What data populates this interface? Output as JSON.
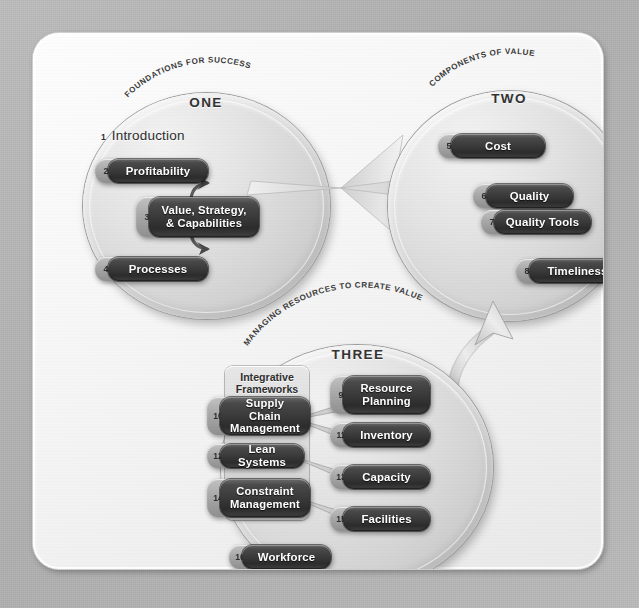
{
  "diagram": {
    "colors": {
      "backdrop": "#b5b5b5",
      "panel": "#f6f6f6",
      "lens": "#d6d6d6",
      "pill_body": "#3a3a3a",
      "pill_number_tab": "#a9a9a9",
      "pill_text": "#ffffff",
      "caption_text": "#3b3b3b"
    }
  },
  "sections": [
    {
      "key": "one",
      "caption": "FOUNDATIONS FOR SUCCESS",
      "roman": "ONE",
      "heading_entry": {
        "number": "1",
        "label": "Introduction"
      },
      "items": [
        {
          "number": "2",
          "label": "Profitability"
        },
        {
          "number": "3",
          "label": "Value, Strategy,\n& Capabilities"
        },
        {
          "number": "4",
          "label": "Processes"
        }
      ]
    },
    {
      "key": "two",
      "caption": "COMPONENTS OF VALUE",
      "roman": "TWO",
      "items": [
        {
          "number": "5",
          "label": "Cost"
        },
        {
          "number": "6",
          "label": "Quality"
        },
        {
          "number": "7",
          "label": "Quality Tools"
        },
        {
          "number": "8",
          "label": "Timeliness"
        }
      ]
    },
    {
      "key": "three",
      "caption": "MANAGING RESOURCES TO CREATE VALUE",
      "roman": "THREE",
      "backing_panel_label": "Integrative\nFrameworks",
      "items_left": [
        {
          "number": "10",
          "label": "Supply Chain\nManagement"
        },
        {
          "number": "12",
          "label": "Lean Systems"
        },
        {
          "number": "14",
          "label": "Constraint\nManagement"
        }
      ],
      "items_right": [
        {
          "number": "9",
          "label": "Resource\nPlanning"
        },
        {
          "number": "11",
          "label": "Inventory"
        },
        {
          "number": "13",
          "label": "Capacity"
        },
        {
          "number": "15",
          "label": "Facilities"
        }
      ],
      "items_bottom": [
        {
          "number": "16",
          "label": "Workforce"
        }
      ]
    }
  ],
  "connectors": [
    {
      "name": "profitability-to-value",
      "from": "2",
      "to": "3"
    },
    {
      "name": "processes-to-value",
      "from": "4",
      "to": "3"
    },
    {
      "name": "one-to-two-bowtie",
      "from": "ONE",
      "to": "TWO"
    },
    {
      "name": "three-to-two-curved-arrow",
      "from": "THREE",
      "to": "TWO"
    },
    {
      "name": "scm-to-resource-planning",
      "from": "10",
      "to": "9"
    },
    {
      "name": "scm-to-inventory",
      "from": "10",
      "to": "11"
    },
    {
      "name": "lean-to-capacity",
      "from": "12",
      "to": "13"
    },
    {
      "name": "constraint-to-facilities",
      "from": "14",
      "to": "15"
    }
  ]
}
